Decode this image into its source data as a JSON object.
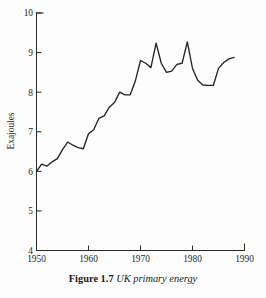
{
  "figure": {
    "caption_label": "Figure 1.7",
    "caption_text": "UK primary energy"
  },
  "chart_data": {
    "type": "line",
    "title": "UK primary energy",
    "xlabel": "",
    "ylabel": "Exajoules",
    "xlim": [
      1950,
      1990
    ],
    "ylim": [
      4,
      10
    ],
    "grid": false,
    "legend": null,
    "x_ticks": [
      1950,
      1960,
      1970,
      1980,
      1990
    ],
    "x_tick_labels": [
      "1950",
      "1960",
      "1970",
      "1980",
      "1990"
    ],
    "y_ticks": [
      4,
      5,
      6,
      7,
      8,
      9,
      10
    ],
    "y_tick_labels": [
      "4",
      "5",
      "6",
      "7",
      "8",
      "9",
      "10"
    ],
    "series": [
      {
        "name": "UK primary energy",
        "color": "#242424",
        "x": [
          1950,
          1951,
          1952,
          1953,
          1954,
          1955,
          1956,
          1957,
          1958,
          1959,
          1960,
          1961,
          1962,
          1963,
          1964,
          1965,
          1966,
          1967,
          1968,
          1969,
          1970,
          1971,
          1972,
          1973,
          1974,
          1975,
          1976,
          1977,
          1978,
          1979,
          1980,
          1981,
          1982,
          1983,
          1984,
          1985,
          1986,
          1987,
          1988
        ],
        "values": [
          6.0,
          6.18,
          6.13,
          6.24,
          6.32,
          6.55,
          6.74,
          6.66,
          6.6,
          6.57,
          6.95,
          7.05,
          7.34,
          7.4,
          7.62,
          7.74,
          8.0,
          7.93,
          7.93,
          8.28,
          8.8,
          8.73,
          8.62,
          9.24,
          8.73,
          8.5,
          8.53,
          8.7,
          8.73,
          9.27,
          8.6,
          8.3,
          8.18,
          8.17,
          8.17,
          8.6,
          8.75,
          8.84,
          8.88
        ]
      }
    ]
  }
}
